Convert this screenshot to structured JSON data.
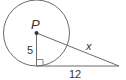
{
  "diagram": {
    "center_label": "P",
    "radius_label": "5",
    "tangent_label": "12",
    "hypotenuse_label": "x",
    "colors": {
      "stroke": "#6b6b6b",
      "text": "#333333"
    }
  }
}
